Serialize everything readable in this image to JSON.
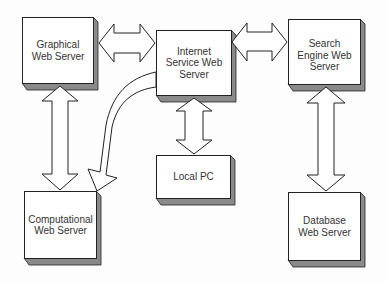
{
  "diagram": {
    "type": "network-architecture",
    "nodes": [
      {
        "id": "graphical",
        "label": "Graphical\nWeb Server"
      },
      {
        "id": "internet",
        "label": "Internet\nService Web\nServer"
      },
      {
        "id": "search",
        "label": "Search\nEngine Web\nServer"
      },
      {
        "id": "localpc",
        "label": "Local PC"
      },
      {
        "id": "computational",
        "label": "Computational\nWeb Server"
      },
      {
        "id": "database",
        "label": "Database\nWeb Server"
      }
    ],
    "edges": [
      {
        "from": "graphical",
        "to": "internet",
        "style": "double-arrow"
      },
      {
        "from": "internet",
        "to": "search",
        "style": "double-arrow"
      },
      {
        "from": "graphical",
        "to": "computational",
        "style": "double-arrow"
      },
      {
        "from": "internet",
        "to": "localpc",
        "style": "double-arrow"
      },
      {
        "from": "search",
        "to": "database",
        "style": "double-arrow"
      },
      {
        "from": "internet",
        "to": "computational",
        "style": "curved-arrow"
      }
    ],
    "colors": {
      "line": "#222222",
      "shadow": "#8a8a8a",
      "fill": "#ffffff"
    }
  }
}
